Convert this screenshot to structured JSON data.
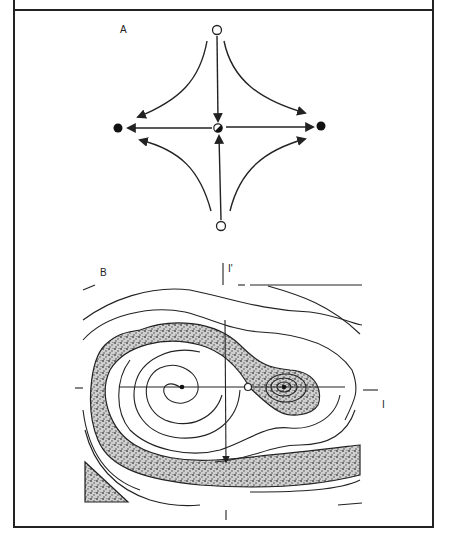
{
  "figure": {
    "panels": [
      {
        "id": "A",
        "label": "A",
        "description": "Saddle point at center with two unstable fixed points (open circles, top and bottom) and two stable fixed points (filled circles, left and right); trajectories flow away from the open circles toward the filled circles.",
        "fixed_points": [
          {
            "name": "top",
            "type": "unstable"
          },
          {
            "name": "bottom",
            "type": "unstable"
          },
          {
            "name": "left",
            "type": "stable"
          },
          {
            "name": "right",
            "type": "stable"
          },
          {
            "name": "center",
            "type": "saddle"
          }
        ]
      },
      {
        "id": "B",
        "label": "B",
        "axis_labels": {
          "vertical": "I'",
          "horizontal": "I"
        },
        "description": "Phase portrait with two spiral attractors separated by a saddle point; the stippled band marks the basin boundary region.",
        "fixed_points": [
          {
            "name": "left-spiral",
            "type": "stable"
          },
          {
            "name": "saddle",
            "type": "saddle"
          },
          {
            "name": "right-spiral",
            "type": "stable"
          }
        ]
      }
    ]
  }
}
